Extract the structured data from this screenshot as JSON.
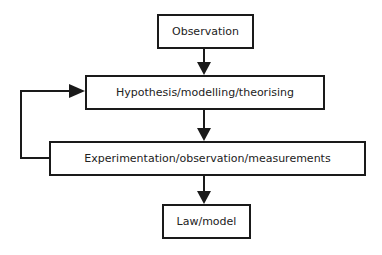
{
  "diagram": {
    "type": "flowchart",
    "nodes": [
      {
        "id": "observation",
        "label": "Observation"
      },
      {
        "id": "hypothesis",
        "label": "Hypothesis/modelling/theorising"
      },
      {
        "id": "experimentation",
        "label": "Experimentation/observation/measurements"
      },
      {
        "id": "law",
        "label": "Law/model"
      }
    ],
    "edges": [
      {
        "from": "observation",
        "to": "hypothesis"
      },
      {
        "from": "hypothesis",
        "to": "experimentation"
      },
      {
        "from": "experimentation",
        "to": "law"
      },
      {
        "from": "experimentation",
        "to": "hypothesis",
        "style": "feedback-loop-left"
      }
    ],
    "colors": {
      "stroke": "#1a1a1a",
      "text": "#222222",
      "background": "#ffffff"
    }
  }
}
